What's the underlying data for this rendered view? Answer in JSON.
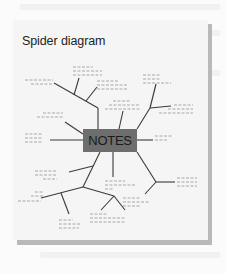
{
  "diagram": {
    "title": "Spider diagram",
    "center_label": "NOTES",
    "colors": {
      "card": "#f5f5f5",
      "shadow": "#b9b9b9",
      "center_box": "#6e6e6e",
      "lines": "#3a3a3a",
      "placeholder_text": "#a8a8a8"
    },
    "branches": [
      {
        "direction": "upper-left",
        "sub_branches": 3
      },
      {
        "direction": "up",
        "sub_branches": 1
      },
      {
        "direction": "upper-right",
        "sub_branches": 2
      },
      {
        "direction": "left",
        "sub_branches": 1
      },
      {
        "direction": "right",
        "sub_branches": 1
      },
      {
        "direction": "down",
        "sub_branches": 1
      },
      {
        "direction": "lower-left",
        "sub_branches": 4
      },
      {
        "direction": "lower-right",
        "sub_branches": 2
      }
    ]
  }
}
